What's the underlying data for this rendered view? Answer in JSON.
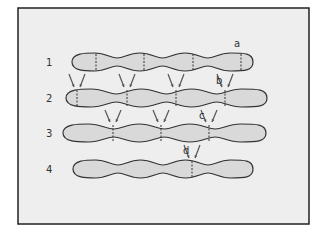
{
  "diagram": {
    "frame": {
      "background": "#eeeeee",
      "border": "#222222"
    },
    "colors": {
      "shape_fill": "#d9d9d9",
      "shape_stroke": "#333333",
      "divider": "#333333",
      "arrow": "#555555"
    },
    "rows": [
      {
        "label": "1",
        "y": 62,
        "x_start": 72,
        "x_end": 253,
        "dividers": [
          96,
          144,
          193,
          241
        ]
      },
      {
        "label": "2",
        "y": 98,
        "x_start": 66,
        "x_end": 267,
        "dividers": [
          77,
          127,
          176,
          225
        ]
      },
      {
        "label": "3",
        "y": 133,
        "x_start": 63,
        "x_end": 266,
        "dividers": [
          113,
          161,
          209
        ]
      },
      {
        "label": "4",
        "y": 169,
        "x_start": 73,
        "x_end": 253,
        "dividers": [
          192
        ]
      }
    ],
    "marks": [
      {
        "label": "a",
        "x": 234,
        "y": 47
      },
      {
        "label": "b",
        "x": 216,
        "y": 84
      },
      {
        "label": "c",
        "x": 199,
        "y": 119
      },
      {
        "label": "d",
        "x": 183,
        "y": 154
      }
    ]
  }
}
